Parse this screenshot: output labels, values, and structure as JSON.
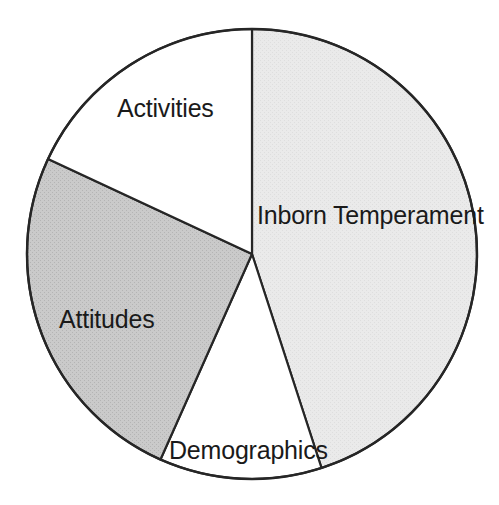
{
  "chart_data": {
    "type": "pie",
    "title": "",
    "subtitle": "",
    "xlabel": "",
    "ylabel": "",
    "legend_position": "none",
    "grid": false,
    "labels_on_slices": true,
    "start_angle_deg": 0,
    "direction": "clockwise",
    "center": {
      "x": 252,
      "y": 254
    },
    "radius": 225,
    "categories": [
      "Inborn Temperament",
      "Demographics",
      "Attitudes",
      "Activities"
    ],
    "values": [
      45.0,
      11.7,
      25.3,
      18.0
    ],
    "units": "percent",
    "slices": [
      {
        "label": "Inborn Temperament",
        "value": 45.0,
        "start_angle_deg": 0,
        "end_angle_deg": 162,
        "sweep_deg": 162,
        "fill": "#e8e8e8",
        "stroke": "#262626",
        "label_x": 257,
        "label_y": 203
      },
      {
        "label": "Demographics",
        "value": 11.7,
        "start_angle_deg": 162,
        "end_angle_deg": 204,
        "sweep_deg": 42,
        "fill": "#ffffff",
        "stroke": "#262626",
        "label_x": 169,
        "label_y": 438
      },
      {
        "label": "Attitudes",
        "value": 25.3,
        "start_angle_deg": 204,
        "end_angle_deg": 295,
        "sweep_deg": 91,
        "fill": "#c5c5c5",
        "stroke": "#262626",
        "label_x": 59,
        "label_y": 307
      },
      {
        "label": "Activities",
        "value": 18.0,
        "start_angle_deg": 295,
        "end_angle_deg": 360,
        "sweep_deg": 65,
        "fill": "#ffffff",
        "stroke": "#262626",
        "label_x": 117,
        "label_y": 96
      }
    ],
    "colors": {
      "inborn_temperament": "#e8e8e8",
      "demographics": "#ffffff",
      "attitudes": "#c5c5c5",
      "activities": "#ffffff",
      "outline": "#262626",
      "text": "#1a1a1a",
      "background": "#ffffff"
    }
  }
}
